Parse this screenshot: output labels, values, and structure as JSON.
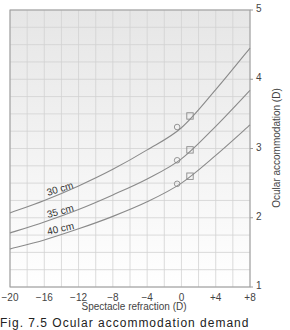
{
  "chart_data": {
    "type": "line",
    "title": "",
    "xlabel": "Spectacle refraction (D)",
    "ylabel": "Ocular accommodation (D)",
    "xlim": [
      -20,
      8
    ],
    "ylim": [
      1,
      5
    ],
    "x_ticks": [
      "-20",
      "-16",
      "-12",
      "-8",
      "-4",
      "0",
      "+4",
      "+8"
    ],
    "x_tick_values": [
      -20,
      -16,
      -12,
      -8,
      -4,
      0,
      4,
      8
    ],
    "y_ticks": [
      "1",
      "2",
      "3",
      "4",
      "5"
    ],
    "y_tick_values": [
      1,
      2,
      3,
      4,
      5
    ],
    "y_axis_position": "right",
    "grid": true,
    "grid_spacing": {
      "x": 2,
      "y": 0.25
    },
    "series": [
      {
        "name": "30 cm",
        "x": [
          -20,
          -16,
          -12,
          -8,
          -4,
          0,
          4,
          8
        ],
        "y": [
          2.07,
          2.25,
          2.46,
          2.7,
          2.98,
          3.3,
          3.85,
          4.45
        ],
        "markers": [
          {
            "shape": "circle",
            "x": -0.5,
            "y": 3.31
          },
          {
            "shape": "square",
            "x": 1,
            "y": 3.47
          }
        ]
      },
      {
        "name": "35 cm",
        "x": [
          -20,
          -16,
          -12,
          -8,
          -4,
          0,
          4,
          8
        ],
        "y": [
          1.78,
          1.94,
          2.12,
          2.33,
          2.56,
          2.85,
          3.32,
          3.84
        ],
        "markers": [
          {
            "shape": "circle",
            "x": -0.5,
            "y": 2.83
          },
          {
            "shape": "square",
            "x": 1,
            "y": 2.98
          }
        ]
      },
      {
        "name": "40 cm",
        "x": [
          -20,
          -16,
          -12,
          -8,
          -4,
          0,
          4,
          8
        ],
        "y": [
          1.55,
          1.68,
          1.84,
          2.02,
          2.23,
          2.5,
          2.9,
          3.34
        ],
        "markers": [
          {
            "shape": "circle",
            "x": -0.5,
            "y": 2.49
          },
          {
            "shape": "square",
            "x": 1,
            "y": 2.6
          }
        ]
      }
    ],
    "annotations": [
      "30 cm",
      "35 cm",
      "40 cm"
    ]
  },
  "caption": "Fig. 7.5  Ocular accommodation demand"
}
